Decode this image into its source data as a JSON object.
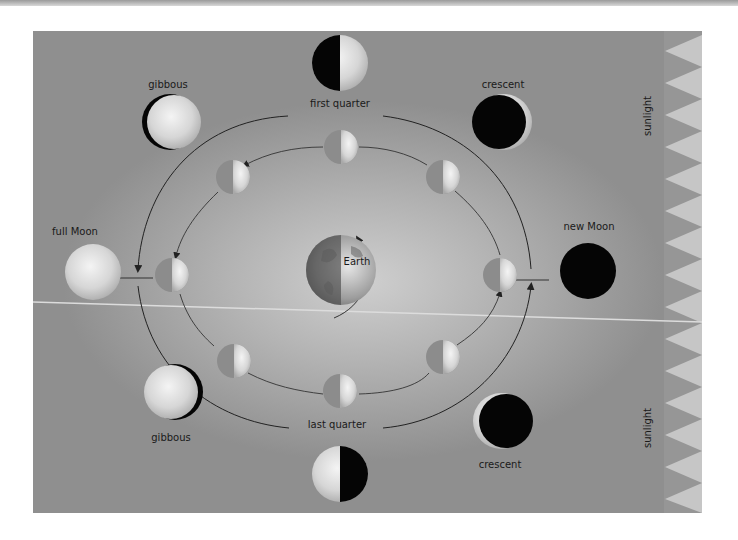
{
  "diagram": {
    "center": {
      "label": "Earth"
    },
    "outer_phases": [
      {
        "id": "first-quarter",
        "label": "first quarter"
      },
      {
        "id": "gibbous-top",
        "label": "gibbous"
      },
      {
        "id": "crescent-top",
        "label": "crescent"
      },
      {
        "id": "full-moon",
        "label": "full Moon"
      },
      {
        "id": "new-moon",
        "label": "new Moon"
      },
      {
        "id": "gibbous-bottom",
        "label": "gibbous"
      },
      {
        "id": "crescent-bottom",
        "label": "crescent"
      },
      {
        "id": "last-quarter",
        "label": "last quarter"
      }
    ],
    "sunlight_labels": [
      "sunlight",
      "sunlight"
    ],
    "colors": {
      "background": "#a8a8a8",
      "sunlight_teeth": "#c4c4c4",
      "moon_dark": "#050505",
      "orbit_line": "#2a2a2a"
    }
  }
}
